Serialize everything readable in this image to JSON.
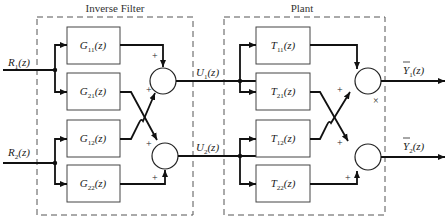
{
  "diagram": {
    "inverse_filter": {
      "title": "Inverse Filter",
      "blocks": [
        {
          "id": "G11",
          "label": "G",
          "sub": "11",
          "arg": "(z)"
        },
        {
          "id": "G21",
          "label": "G",
          "sub": "21",
          "arg": "(z)"
        },
        {
          "id": "G12",
          "label": "G",
          "sub": "12",
          "arg": "(z)"
        },
        {
          "id": "G22",
          "label": "G",
          "sub": "22",
          "arg": "(z)"
        }
      ],
      "sums": [
        {
          "id": "sum1",
          "signs": [
            "+",
            "+"
          ]
        },
        {
          "id": "sum2",
          "signs": [
            "+",
            "+"
          ]
        }
      ]
    },
    "plant": {
      "title": "Plant",
      "blocks": [
        {
          "id": "T11",
          "label": "T",
          "sub": "11",
          "arg": "(z)"
        },
        {
          "id": "T21",
          "label": "T",
          "sub": "21",
          "arg": "(z)"
        },
        {
          "id": "T12",
          "label": "T",
          "sub": "12",
          "arg": "(z)"
        },
        {
          "id": "T22",
          "label": "T",
          "sub": "22",
          "arg": "(z)"
        }
      ],
      "sums": [
        {
          "id": "sum3",
          "signs": [
            "+",
            "×"
          ]
        },
        {
          "id": "sum4",
          "signs": [
            "+",
            "+"
          ]
        }
      ]
    },
    "signals": {
      "inputs": [
        {
          "label": "R",
          "sub": "1",
          "arg": "(z)"
        },
        {
          "label": "R",
          "sub": "2",
          "arg": "(z)"
        }
      ],
      "intermediate": [
        {
          "label": "U",
          "sub": "1",
          "arg": "(z)"
        },
        {
          "label": "U",
          "sub": "2",
          "arg": "(z)"
        }
      ],
      "outputs": [
        {
          "label": "Y",
          "sub": "1",
          "arg": "(z)",
          "overbar": true
        },
        {
          "label": "Y",
          "sub": "2",
          "arg": "(z)",
          "overbar": true
        }
      ]
    }
  }
}
